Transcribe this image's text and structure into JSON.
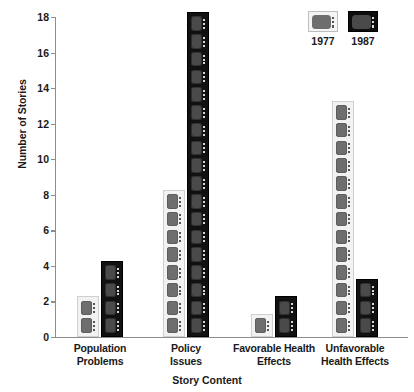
{
  "chart_data": {
    "type": "bar",
    "title": "",
    "subtitle": "",
    "xlabel": "Story Content",
    "ylabel": "Number of Stories",
    "categories": [
      "Population Problems",
      "Policy Issues",
      "Favorable Health Effects",
      "Unfavorable Health Effects"
    ],
    "category_lines": [
      [
        "Population",
        "Problems"
      ],
      [
        "Policy",
        "Issues"
      ],
      [
        "Favorable Health",
        "Effects"
      ],
      [
        "Unfavorable",
        "Health Effects"
      ]
    ],
    "series": [
      {
        "name": "1977",
        "values": [
          2,
          8,
          1,
          13
        ],
        "color": "#f2f2f2",
        "icon": "tv-icon-light"
      },
      {
        "name": "1987",
        "values": [
          4,
          18,
          2,
          3
        ],
        "color": "#111111",
        "icon": "tv-icon-dark"
      }
    ],
    "ylim": [
      0,
      18
    ],
    "ytick_values": [
      0,
      2,
      4,
      6,
      8,
      10,
      12,
      14,
      16,
      18
    ],
    "ytick_labels": [
      "0",
      "2",
      "4",
      "6",
      "8",
      "10",
      "12",
      "14",
      "16",
      "18"
    ],
    "grid": false,
    "legend_position": "top-right",
    "pictogram_unit": 1,
    "pictogram_symbol": "television-set"
  },
  "legend": {
    "entries": [
      {
        "label": "1977",
        "swatch": "tv-icon-light"
      },
      {
        "label": "1987",
        "swatch": "tv-icon-dark"
      }
    ]
  }
}
